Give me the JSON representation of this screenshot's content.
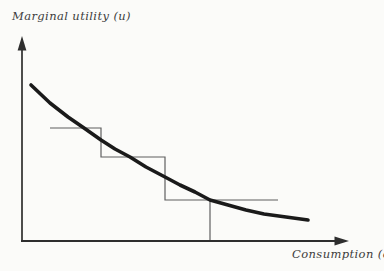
{
  "figure": {
    "background": "#fbfbf9",
    "curve_color": "#1a1a1a",
    "step_color": "#5f5f5f",
    "axis_color": "#2e2e2e",
    "label_color": "#3d3d3d"
  },
  "labels": {
    "y_axis": "Marginal utility (u)",
    "x_axis": "Consumption (c)"
  },
  "chart_data": {
    "type": "line",
    "title": "",
    "xlabel": "Consumption (c)",
    "ylabel": "Marginal utility (u)",
    "grid": false,
    "legend": null,
    "tick_labels": [],
    "axes_px": {
      "origin": [
        22,
        241
      ],
      "y_arrow_tip": [
        22,
        37
      ],
      "x_arrow_tip": [
        348,
        241
      ]
    },
    "series": [
      {
        "name": "marginal utility curve",
        "kind": "smooth",
        "stroke_width": 3.6,
        "points_px": [
          [
            31,
            85
          ],
          [
            50,
            103
          ],
          [
            68,
            117
          ],
          [
            84,
            128
          ],
          [
            101,
            140
          ],
          [
            115,
            149
          ],
          [
            130,
            157
          ],
          [
            146,
            167
          ],
          [
            165,
            177
          ],
          [
            180,
            185
          ],
          [
            195,
            192
          ],
          [
            210,
            200
          ],
          [
            228,
            205
          ],
          [
            246,
            210
          ],
          [
            264,
            214
          ],
          [
            286,
            217
          ],
          [
            308,
            220
          ]
        ]
      },
      {
        "name": "step approximation of utility curve",
        "kind": "steps",
        "stroke_width": 1.2,
        "points_px": [
          [
            50,
            128
          ],
          [
            101,
            128
          ],
          [
            101,
            157
          ],
          [
            165,
            157
          ],
          [
            165,
            200
          ],
          [
            278,
            200
          ]
        ]
      }
    ],
    "annotations": [
      {
        "name": "consumption dropline",
        "kind": "vertical line",
        "points_px": [
          [
            210,
            200
          ],
          [
            210,
            241
          ]
        ]
      }
    ]
  }
}
